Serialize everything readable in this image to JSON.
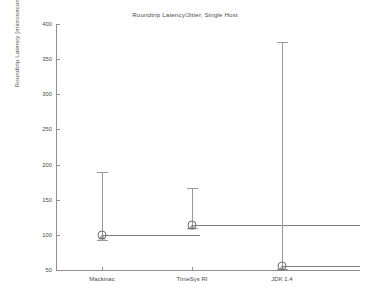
{
  "chart_data": {
    "type": "line",
    "title": "Roundtrip Latency/Jitter, Single Host",
    "xlabel": "",
    "ylabel": "Roundtrip Latency [microseconds]",
    "categories": [
      "Mackinac",
      "TimeSys RI",
      "JDK 1.4"
    ],
    "values": [
      100,
      114,
      56
    ],
    "error_low": [
      93,
      110,
      52
    ],
    "error_high": [
      190,
      167,
      375
    ],
    "ylim": [
      50,
      400
    ],
    "yticks": [
      50,
      100,
      150,
      200,
      250,
      300,
      350,
      400
    ],
    "ytick_labels": [
      "50",
      "100",
      "150",
      "200",
      "250",
      "300",
      "350",
      "400"
    ],
    "grid": false,
    "legend": false,
    "series": [
      {
        "name": "Mackinac",
        "mean": 100,
        "min": 93,
        "max": 190,
        "step_value": 100
      },
      {
        "name": "TimeSys RI",
        "mean": 114,
        "min": 110,
        "max": 167,
        "step_value": 114
      },
      {
        "name": "JDK 1.4",
        "mean": 56,
        "min": 52,
        "max": 375,
        "step_value": 56
      }
    ],
    "marker_style": "circle-with-errorbar",
    "line_color": "#7d7d7d",
    "axis_color": "#8f8f8f",
    "text_color": "#4a4a4a",
    "background": "#ffffff"
  }
}
